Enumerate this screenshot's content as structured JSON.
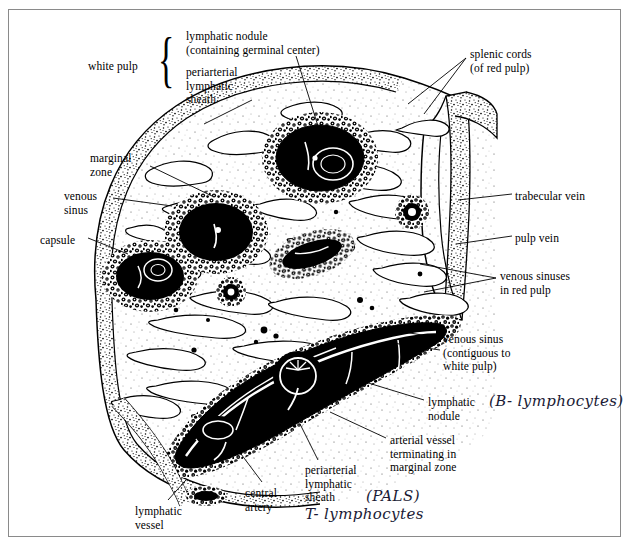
{
  "figure": {
    "style": "black ink line drawing with stipple shading",
    "frame_color": "#8a8a8a",
    "ink_color": "#000000",
    "handwriting_color": "#1a1a35"
  },
  "labels": [
    {
      "id": "white-pulp",
      "text": "white pulp",
      "x": 88,
      "y": 60,
      "brace": true
    },
    {
      "id": "lymphatic-nodule-top",
      "text": "lymphatic nodule\n(containing germinal center)",
      "x": 186,
      "y": 30
    },
    {
      "id": "periarterial-lymphatic-sheath-top",
      "text": "periarterial\nlymphatic\nsheath",
      "x": 186,
      "y": 66
    },
    {
      "id": "splenic-cords",
      "text": "splenic cords\n(of red pulp)",
      "x": 470,
      "y": 48
    },
    {
      "id": "marginal-zone",
      "text": "marginal\nzone",
      "x": 90,
      "y": 152
    },
    {
      "id": "venous-sinus",
      "text": "venous\nsinus",
      "x": 64,
      "y": 190
    },
    {
      "id": "capsule",
      "text": "capsule",
      "x": 40,
      "y": 234
    },
    {
      "id": "trabecular-vein",
      "text": "trabecular vein",
      "x": 515,
      "y": 190
    },
    {
      "id": "pulp-vein",
      "text": "pulp vein",
      "x": 515,
      "y": 232
    },
    {
      "id": "venous-sinuses-red-pulp",
      "text": "venous sinuses\nin red pulp",
      "x": 500,
      "y": 270
    },
    {
      "id": "venous-sinus-contiguous",
      "text": "venous sinus\n(contiguous to\nwhite pulp)",
      "x": 443,
      "y": 333
    },
    {
      "id": "lymphatic-nodule-lower",
      "text": "lymphatic\nnodule",
      "x": 428,
      "y": 396
    },
    {
      "id": "arterial-vessel",
      "text": "arterial vessel\nterminating in\nmarginal zone",
      "x": 390,
      "y": 434
    },
    {
      "id": "periarterial-lymphatic-sheath-lower",
      "text": "periarterial\nlymphatic\nsheath",
      "x": 305,
      "y": 464
    },
    {
      "id": "central-artery",
      "text": "central\nartery",
      "x": 245,
      "y": 487
    },
    {
      "id": "lymphatic-vessel",
      "text": "lymphatic\nvessel",
      "x": 135,
      "y": 505
    }
  ],
  "handwritten_annotations": [
    {
      "id": "b-lymphocytes",
      "text": "(B- lymphocytes)",
      "x": 489,
      "y": 392
    },
    {
      "id": "pals",
      "text": "(PALS)",
      "x": 366,
      "y": 487
    },
    {
      "id": "t-lymphocytes",
      "text": "T- lymphocytes",
      "x": 305,
      "y": 505
    }
  ]
}
